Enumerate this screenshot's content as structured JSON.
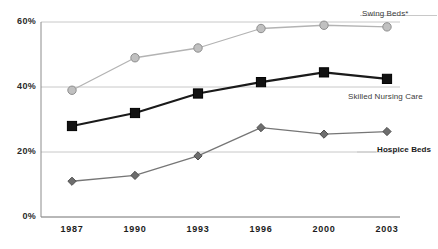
{
  "chart_data": {
    "type": "line",
    "title": "",
    "subtitle": "",
    "xlabel": "",
    "ylabel": "",
    "categories": [
      "1987",
      "1990",
      "1993",
      "1996",
      "2000",
      "2003"
    ],
    "ylim": [
      0,
      60
    ],
    "yticks": [
      0,
      20,
      40,
      60
    ],
    "ytick_labels": [
      "0%",
      "20%",
      "40%",
      "60%"
    ],
    "grid": "horizontal",
    "legend_position": "right-inline",
    "series": [
      {
        "name": "Swing Beds*",
        "values": [
          39,
          49,
          52,
          58,
          59,
          58.5
        ],
        "color": "#b3b3b3",
        "marker": "circle",
        "marker_fill": "#c0c0c0",
        "marker_stroke": "#8f8f8f",
        "label_bold": false
      },
      {
        "name": "Skilled Nursing Care",
        "values": [
          28,
          32,
          38,
          41.5,
          44.5,
          42.5
        ],
        "color": "#1a1a1a",
        "marker": "square",
        "marker_fill": "#111111",
        "marker_stroke": "#000000",
        "label_bold": false
      },
      {
        "name": "Hospice Beds",
        "values": [
          11,
          12.8,
          18.8,
          27.5,
          25.5,
          26.3
        ],
        "color": "#767676",
        "marker": "diamond",
        "marker_fill": "#6e6e6e",
        "marker_stroke": "#4d4d4d",
        "label_bold": true
      }
    ]
  },
  "axis": {
    "ytick_labels": [
      "60%",
      "40%",
      "20%",
      "0%"
    ],
    "xtick_labels": [
      "1987",
      "1990",
      "1993",
      "1996",
      "2000",
      "2003"
    ]
  },
  "series_labels": {
    "swing_beds": "Swing Beds*",
    "skilled_nursing": "Skilled Nursing Care",
    "hospice_beds": "Hospice Beds"
  },
  "colors": {
    "gridline": "#c8c8c8",
    "axis": "#8c8c8c",
    "swing": "#b3b3b3",
    "skilled": "#1a1a1a",
    "hospice": "#767676",
    "background": "#ffffff"
  }
}
